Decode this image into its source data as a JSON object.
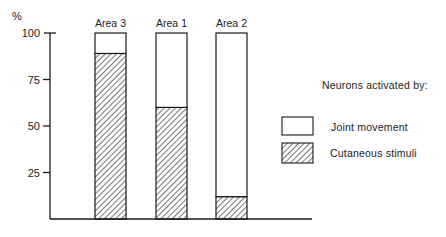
{
  "chart_data": {
    "type": "bar",
    "stacked": true,
    "title": "",
    "xlabel": "",
    "ylabel": "%",
    "ylim": [
      0,
      100
    ],
    "yticks": [
      25,
      50,
      75,
      100
    ],
    "grid": false,
    "categories": [
      "Area 3",
      "Area 1",
      "Area 2"
    ],
    "series": [
      {
        "name": "Cutaneous stimuli",
        "pattern": "hatched",
        "values": [
          89,
          60,
          12
        ]
      },
      {
        "name": "Joint movement",
        "pattern": "open",
        "values": [
          11,
          40,
          88
        ]
      }
    ],
    "legend": {
      "title": "Neurons activated by:",
      "placement": "right",
      "entries": [
        {
          "label": "Joint movement",
          "pattern": "open"
        },
        {
          "label": "Cutaneous stimuli",
          "pattern": "hatched"
        }
      ]
    }
  },
  "colors": {
    "ink": "#1a1a1a",
    "background": "#ffffff"
  }
}
